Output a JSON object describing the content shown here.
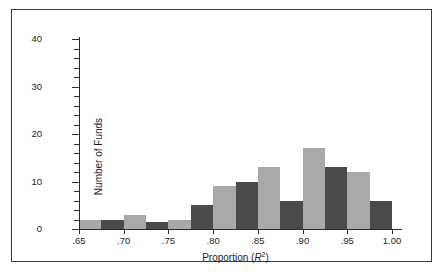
{
  "chart_data": {
    "type": "bar",
    "title": "",
    "subtitle": "",
    "xlabel_parts": {
      "prefix": "Proportion (",
      "symbol": "R",
      "exponent": "2",
      "suffix": ")"
    },
    "xlabel": "Proportion (R2)",
    "ylabel": "Number of Funds",
    "xlim": [
      0.65,
      1.0
    ],
    "ylim": [
      0,
      40
    ],
    "grid": false,
    "legend": "none",
    "bin_width": 0.025,
    "x_tick_labels": [
      ".65",
      ".70",
      ".75",
      ".80",
      ".85",
      ".90",
      ".95",
      "1.00"
    ],
    "x_tick_values": [
      0.65,
      0.7,
      0.75,
      0.8,
      0.85,
      0.9,
      0.95,
      1.0
    ],
    "y_tick_labels": [
      "0",
      "10",
      "20",
      "30",
      "40"
    ],
    "y_tick_values": [
      0,
      10,
      20,
      30,
      40
    ],
    "y_minor_tick_step": 2,
    "colors": {
      "light_bar": "#a9a9a9",
      "dark_bar": "#4a4a4a",
      "axis": "#2b2b2b",
      "frame": "#3a3a3a",
      "text": "#1d1d1d"
    },
    "categories": [
      "0.650-0.675",
      "0.675-0.700",
      "0.700-0.725",
      "0.725-0.750",
      "0.750-0.775",
      "0.775-0.800",
      "0.800-0.825",
      "0.825-0.850",
      "0.850-0.875",
      "0.875-0.900",
      "0.900-0.925",
      "0.925-0.950",
      "0.950-0.975",
      "0.975-1.000"
    ],
    "values": [
      2,
      2,
      3,
      1.5,
      2,
      5,
      9,
      10,
      13,
      6,
      17,
      13,
      12,
      6
    ],
    "bar_shades": [
      "light",
      "dark",
      "light",
      "dark",
      "light",
      "dark",
      "light",
      "dark",
      "light",
      "dark",
      "light",
      "dark",
      "light",
      "dark"
    ]
  }
}
